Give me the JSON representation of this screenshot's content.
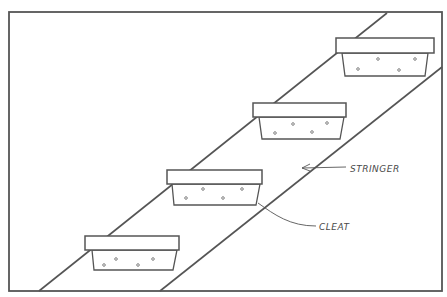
{
  "diagram": {
    "title": "",
    "colors": {
      "line": "#555555",
      "background": "#ffffff"
    },
    "frame": {
      "x": 9,
      "y": 12,
      "w": 433,
      "h": 279
    },
    "stringers": [
      {
        "name": "upper",
        "x1": 39,
        "y1": 291,
        "x2": 387,
        "y2": 13
      },
      {
        "name": "lower",
        "x1": 160,
        "y1": 291,
        "x2": 442,
        "y2": 67
      }
    ],
    "steps": [
      {
        "tread": {
          "x": 85,
          "y": 236,
          "w": 94,
          "h": 14
        },
        "cleat": {
          "tl": 92,
          "tr": 177,
          "bl": 94,
          "br": 173,
          "top": 250,
          "bottom": 270
        },
        "nails": [
          [
            116,
            259
          ],
          [
            153,
            259
          ],
          [
            104,
            265
          ],
          [
            138,
            265
          ]
        ]
      },
      {
        "tread": {
          "x": 167,
          "y": 170,
          "w": 95,
          "h": 14
        },
        "cleat": {
          "tl": 172,
          "tr": 260,
          "bl": 174,
          "br": 256,
          "top": 184,
          "bottom": 205
        },
        "nails": [
          [
            203,
            189
          ],
          [
            242,
            189
          ],
          [
            186,
            198
          ],
          [
            223,
            198
          ]
        ]
      },
      {
        "tread": {
          "x": 253,
          "y": 103,
          "w": 93,
          "h": 14
        },
        "cleat": {
          "tl": 259,
          "tr": 344,
          "bl": 262,
          "br": 340,
          "top": 117,
          "bottom": 139
        },
        "nails": [
          [
            293,
            124
          ],
          [
            327,
            123
          ],
          [
            275,
            133
          ],
          [
            312,
            132
          ]
        ]
      },
      {
        "tread": {
          "x": 336,
          "y": 38,
          "w": 98,
          "h": 15
        },
        "cleat": {
          "tl": 342,
          "tr": 428,
          "bl": 345,
          "br": 425,
          "top": 53,
          "bottom": 76
        },
        "nails": [
          [
            378,
            59
          ],
          [
            415,
            59
          ],
          [
            358,
            69
          ],
          [
            399,
            70
          ]
        ]
      }
    ],
    "labels": {
      "stringer": {
        "text": "STRINGER",
        "x": 350,
        "y": 172
      },
      "cleat": {
        "text": "CLEAT",
        "x": 319,
        "y": 230
      }
    }
  }
}
